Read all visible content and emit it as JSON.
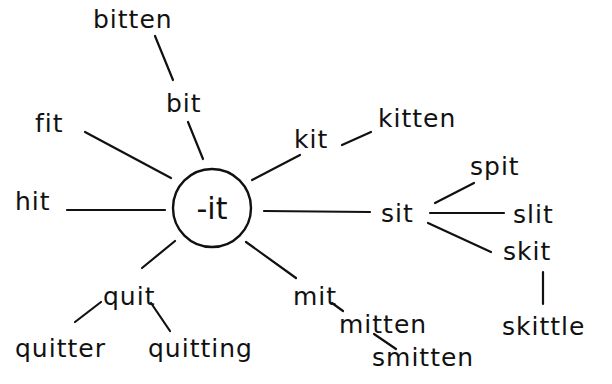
{
  "diagram": {
    "type": "word-family-web",
    "center": {
      "label": "-it",
      "x": 212,
      "y": 208,
      "r": 39
    },
    "nodes": [
      {
        "id": "bitten",
        "label": "bitten",
        "x": 93,
        "y": 28
      },
      {
        "id": "bit",
        "label": "bit",
        "x": 166,
        "y": 112
      },
      {
        "id": "fit",
        "label": "fit",
        "x": 35,
        "y": 132
      },
      {
        "id": "kit",
        "label": "kit",
        "x": 294,
        "y": 148
      },
      {
        "id": "kitten",
        "label": "kitten",
        "x": 378,
        "y": 127
      },
      {
        "id": "hit",
        "label": "hit",
        "x": 15,
        "y": 210
      },
      {
        "id": "sit",
        "label": "sit",
        "x": 381,
        "y": 222
      },
      {
        "id": "spit",
        "label": "spit",
        "x": 470,
        "y": 175
      },
      {
        "id": "slit",
        "label": "slit",
        "x": 513,
        "y": 223
      },
      {
        "id": "skit",
        "label": "skit",
        "x": 503,
        "y": 260
      },
      {
        "id": "skittle",
        "label": "skittle",
        "x": 502,
        "y": 335
      },
      {
        "id": "mit",
        "label": "mit",
        "x": 293,
        "y": 305
      },
      {
        "id": "mitten",
        "label": "mitten",
        "x": 339,
        "y": 333
      },
      {
        "id": "smitten",
        "label": "smitten",
        "x": 372,
        "y": 366
      },
      {
        "id": "quit",
        "label": "quit",
        "x": 103,
        "y": 305
      },
      {
        "id": "quitter",
        "label": "quitter",
        "x": 15,
        "y": 357
      },
      {
        "id": "quitting",
        "label": "quitting",
        "x": 148,
        "y": 357
      }
    ],
    "edges": [
      {
        "from": "-it",
        "to": "bit",
        "x1": 203,
        "y1": 159,
        "x2": 188,
        "y2": 122
      },
      {
        "from": "bit",
        "to": "bitten",
        "x1": 173,
        "y1": 80,
        "x2": 155,
        "y2": 36
      },
      {
        "from": "-it",
        "to": "fit",
        "x1": 171,
        "y1": 178,
        "x2": 85,
        "y2": 132
      },
      {
        "from": "-it",
        "to": "kit",
        "x1": 252,
        "y1": 180,
        "x2": 300,
        "y2": 155
      },
      {
        "from": "kit",
        "to": "kitten",
        "x1": 342,
        "y1": 145,
        "x2": 371,
        "y2": 132
      },
      {
        "from": "-it",
        "to": "hit",
        "x1": 165,
        "y1": 210,
        "x2": 67,
        "y2": 210
      },
      {
        "from": "-it",
        "to": "sit",
        "x1": 264,
        "y1": 211,
        "x2": 370,
        "y2": 212
      },
      {
        "from": "sit",
        "to": "spit",
        "x1": 435,
        "y1": 203,
        "x2": 474,
        "y2": 183
      },
      {
        "from": "sit",
        "to": "slit",
        "x1": 430,
        "y1": 213,
        "x2": 504,
        "y2": 213
      },
      {
        "from": "sit",
        "to": "skit",
        "x1": 428,
        "y1": 223,
        "x2": 491,
        "y2": 252
      },
      {
        "from": "skit",
        "to": "skittle",
        "x1": 543,
        "y1": 272,
        "x2": 543,
        "y2": 304
      },
      {
        "from": "-it",
        "to": "mit",
        "x1": 246,
        "y1": 242,
        "x2": 296,
        "y2": 278
      },
      {
        "from": "mit",
        "to": "mitten",
        "x1": 332,
        "y1": 303,
        "x2": 343,
        "y2": 311
      },
      {
        "from": "mitten",
        "to": "smitten",
        "x1": 374,
        "y1": 334,
        "x2": 396,
        "y2": 349
      },
      {
        "from": "-it",
        "to": "quit",
        "x1": 175,
        "y1": 241,
        "x2": 142,
        "y2": 268
      },
      {
        "from": "quit",
        "to": "quitter",
        "x1": 101,
        "y1": 302,
        "x2": 75,
        "y2": 322
      },
      {
        "from": "quit",
        "to": "quitting",
        "x1": 151,
        "y1": 303,
        "x2": 170,
        "y2": 331
      }
    ]
  }
}
